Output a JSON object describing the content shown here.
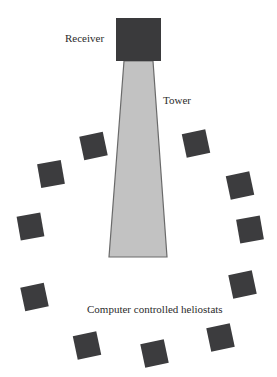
{
  "diagram": {
    "labels": {
      "receiver": "Receiver",
      "tower": "Tower",
      "heliostats": "Computer controlled heliostats"
    },
    "colors": {
      "receiver": "#3a3a3c",
      "tower_fill": "#c2c2c2",
      "tower_stroke": "#6a6a6a",
      "heliostat": "#3c3c3e",
      "text": "#2b2b2b",
      "background": "#ffffff"
    },
    "receiver": {
      "x": 116,
      "y": 18,
      "width": 45,
      "height": 43
    },
    "tower": {
      "top_left": [
        124,
        61
      ],
      "top_right": [
        153,
        61
      ],
      "bottom_right": [
        167,
        257
      ],
      "bottom_left": [
        109,
        257
      ]
    },
    "heliostats": [
      {
        "cx": 93.5,
        "cy": 146,
        "size": 24,
        "rotation": -12
      },
      {
        "cx": 51,
        "cy": 174,
        "size": 24,
        "rotation": -10
      },
      {
        "cx": 30.5,
        "cy": 226.5,
        "size": 24,
        "rotation": -10
      },
      {
        "cx": 34.5,
        "cy": 297,
        "size": 24,
        "rotation": -12
      },
      {
        "cx": 87,
        "cy": 345.5,
        "size": 24,
        "rotation": -12
      },
      {
        "cx": 154.5,
        "cy": 353.5,
        "size": 24,
        "rotation": -12
      },
      {
        "cx": 220.5,
        "cy": 337.5,
        "size": 24,
        "rotation": -12
      },
      {
        "cx": 242.5,
        "cy": 284.5,
        "size": 24,
        "rotation": -12
      },
      {
        "cx": 250,
        "cy": 229.5,
        "size": 24,
        "rotation": -10
      },
      {
        "cx": 240,
        "cy": 185.5,
        "size": 24,
        "rotation": -12
      },
      {
        "cx": 196,
        "cy": 143.5,
        "size": 24,
        "rotation": -12
      }
    ]
  }
}
